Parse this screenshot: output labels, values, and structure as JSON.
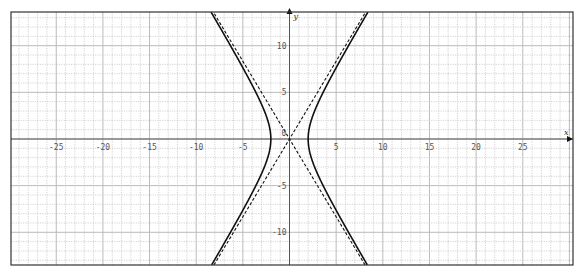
{
  "chart_data": {
    "type": "line",
    "title": "",
    "xlabel": "x",
    "ylabel": "y",
    "xlim": [
      -30,
      30
    ],
    "ylim": [
      -13.5,
      13.6
    ],
    "grid": true,
    "minor_grid_step": 1,
    "x_ticks": [
      -25,
      -20,
      -15,
      -10,
      -5,
      5,
      10,
      15,
      20,
      25
    ],
    "x_tick_labels": [
      "-25",
      "-20",
      "-15",
      "-10",
      "-5",
      "5",
      "10",
      "15",
      "20",
      "25"
    ],
    "y_ticks": [
      -10,
      -5,
      5,
      10
    ],
    "y_tick_labels": [
      "-10",
      "-5",
      "5",
      "10"
    ],
    "origin_label": "0",
    "series": [
      {
        "name": "hyperbola",
        "style": "solid",
        "equation": "x^2/4 - y^2/(100/9) = 1",
        "a": 2,
        "b": 3.333
      },
      {
        "name": "asymptote-positive",
        "style": "dashed",
        "equation": "y = (5/3) x",
        "slope": 1.667
      },
      {
        "name": "asymptote-negative",
        "style": "dashed",
        "equation": "y = -(5/3) x",
        "slope": -1.667
      }
    ]
  }
}
